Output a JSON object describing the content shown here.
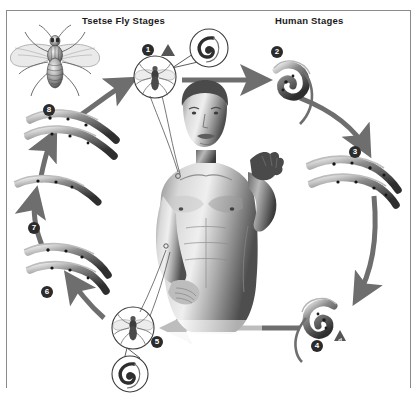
{
  "diagram": {
    "headers": {
      "fly_stages": "Tsetse Fly Stages",
      "human_stages": "Human Stages"
    },
    "colors": {
      "arrow": "#6e6e6e",
      "marker_fill": "#2b2b2b",
      "marker_text": "#ffffff",
      "triangle": "#555555",
      "border": "#8a8a8a",
      "background": "#ffffff"
    },
    "stages": [
      {
        "number": "1",
        "label": "1",
        "side": "fly",
        "icon": "tsetse-fly-circled-icon",
        "warning": true,
        "warning_letter": ""
      },
      {
        "number": "2",
        "label": "2",
        "side": "human",
        "icon": "trypomastigote-icon",
        "warning": false,
        "warning_letter": ""
      },
      {
        "number": "3",
        "label": "3",
        "side": "human",
        "icon": "dividing-trypomastigotes-icon",
        "warning": false,
        "warning_letter": ""
      },
      {
        "number": "4",
        "label": "4",
        "side": "human",
        "icon": "trypomastigote-icon",
        "warning": true,
        "warning_letter": "d"
      },
      {
        "number": "5",
        "label": "5",
        "side": "fly",
        "icon": "tsetse-fly-circled-icon",
        "warning": false,
        "warning_letter": ""
      },
      {
        "number": "6",
        "label": "6",
        "side": "fly",
        "icon": "dividing-trypomastigotes-icon",
        "warning": false,
        "warning_letter": ""
      },
      {
        "number": "7",
        "label": "7",
        "side": "fly",
        "icon": "migration-arrow-icon",
        "warning": false,
        "warning_letter": ""
      },
      {
        "number": "8",
        "label": "8",
        "side": "fly",
        "icon": "dividing-trypomastigotes-icon",
        "warning": false,
        "warning_letter": ""
      }
    ],
    "illustrations": {
      "tsetse_fly": "tsetse-fly-illustration",
      "human_figure": "human-male-figure-illustration",
      "callout_top": "parasite-callout-spiral-top",
      "callout_bottom": "parasite-callout-spiral-bottom"
    }
  }
}
